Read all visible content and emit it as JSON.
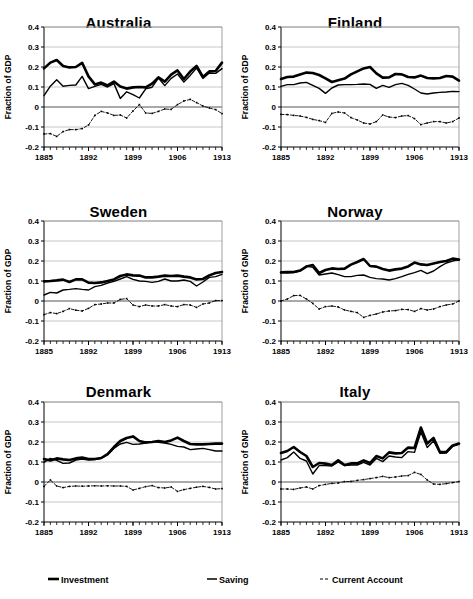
{
  "legend": {
    "position": "bottom",
    "items": [
      {
        "label": "Investment",
        "key": "thick-solid-line",
        "color": "#000000"
      },
      {
        "label": "Saving",
        "key": "thin-solid-line",
        "color": "#000000"
      },
      {
        "label": "Current Account",
        "key": "dashed-line",
        "color": "#000000"
      }
    ]
  },
  "axes": {
    "ytick_labels": [
      "0.4",
      "0.3",
      "0.2",
      "0.1",
      "0",
      "-0.1",
      "-0.2"
    ],
    "ytick_values": [
      0.4,
      0.3,
      0.2,
      0.1,
      0,
      -0.1,
      -0.2
    ],
    "xtick_labels": [
      "1885",
      "1892",
      "1899",
      "1906",
      "1913"
    ],
    "xtick_values": [
      1885,
      1892,
      1899,
      1906,
      1913
    ],
    "xlim": [
      1885,
      1913
    ],
    "ylim": [
      -0.2,
      0.4
    ],
    "minor_xtick_step": 1,
    "grid": "horizontal-only"
  },
  "chart_data": [
    {
      "type": "line",
      "title": "Australia",
      "xlabel": "",
      "ylabel": "Fraction of GDP",
      "xlim": [
        1885,
        1913
      ],
      "ylim": [
        -0.2,
        0.4
      ],
      "x": [
        1885,
        1886,
        1887,
        1888,
        1889,
        1890,
        1891,
        1892,
        1893,
        1894,
        1895,
        1896,
        1897,
        1898,
        1899,
        1900,
        1901,
        1902,
        1903,
        1904,
        1905,
        1906,
        1907,
        1908,
        1909,
        1910,
        1911,
        1912,
        1913
      ],
      "series": [
        {
          "name": "Investment",
          "style": "thick-solid",
          "values": [
            0.193,
            0.222,
            0.235,
            0.205,
            0.198,
            0.2,
            0.221,
            0.153,
            0.113,
            0.122,
            0.108,
            0.127,
            0.102,
            0.092,
            0.098,
            0.1,
            0.098,
            0.117,
            0.148,
            0.127,
            0.162,
            0.183,
            0.14,
            0.177,
            0.205,
            0.15,
            0.178,
            0.18,
            0.222
          ]
        },
        {
          "name": "Saving",
          "style": "thin-solid",
          "values": [
            0.057,
            0.104,
            0.136,
            0.104,
            0.108,
            0.11,
            0.153,
            0.092,
            0.103,
            0.113,
            0.1,
            0.117,
            0.043,
            0.076,
            0.062,
            0.045,
            0.091,
            0.099,
            0.145,
            0.107,
            0.143,
            0.165,
            0.125,
            0.158,
            0.195,
            0.143,
            0.17,
            0.168,
            0.192
          ]
        },
        {
          "name": "Current Account",
          "style": "dashed",
          "values": [
            -0.135,
            -0.133,
            -0.147,
            -0.123,
            -0.113,
            -0.113,
            -0.108,
            -0.09,
            -0.042,
            -0.022,
            -0.03,
            -0.042,
            -0.04,
            -0.055,
            -0.02,
            0.012,
            -0.03,
            -0.032,
            -0.022,
            -0.01,
            -0.012,
            0.012,
            0.03,
            0.038,
            0.022,
            0.005,
            -0.005,
            -0.013,
            -0.033
          ]
        }
      ]
    },
    {
      "type": "line",
      "title": "Finland",
      "xlabel": "",
      "ylabel": "Fraction of GDP",
      "xlim": [
        1885,
        1913
      ],
      "ylim": [
        -0.2,
        0.4
      ],
      "x": [
        1885,
        1886,
        1887,
        1888,
        1889,
        1890,
        1891,
        1892,
        1893,
        1894,
        1895,
        1896,
        1897,
        1898,
        1899,
        1900,
        1901,
        1902,
        1903,
        1904,
        1905,
        1906,
        1907,
        1908,
        1909,
        1910,
        1911,
        1912,
        1913
      ],
      "series": [
        {
          "name": "Investment",
          "style": "thick-solid",
          "values": [
            0.14,
            0.15,
            0.152,
            0.163,
            0.172,
            0.17,
            0.16,
            0.143,
            0.125,
            0.134,
            0.142,
            0.163,
            0.178,
            0.193,
            0.2,
            0.168,
            0.147,
            0.148,
            0.165,
            0.163,
            0.15,
            0.148,
            0.157,
            0.145,
            0.143,
            0.145,
            0.155,
            0.152,
            0.132
          ]
        },
        {
          "name": "Saving",
          "style": "thin-solid",
          "values": [
            0.103,
            0.112,
            0.112,
            0.12,
            0.123,
            0.108,
            0.093,
            0.068,
            0.095,
            0.11,
            0.112,
            0.112,
            0.113,
            0.115,
            0.113,
            0.093,
            0.108,
            0.098,
            0.112,
            0.118,
            0.108,
            0.09,
            0.07,
            0.065,
            0.07,
            0.073,
            0.075,
            0.078,
            0.077
          ]
        },
        {
          "name": "Current Account",
          "style": "dashed",
          "values": [
            -0.037,
            -0.038,
            -0.042,
            -0.045,
            -0.052,
            -0.062,
            -0.068,
            -0.077,
            -0.032,
            -0.025,
            -0.03,
            -0.053,
            -0.065,
            -0.08,
            -0.085,
            -0.073,
            -0.04,
            -0.05,
            -0.053,
            -0.045,
            -0.043,
            -0.058,
            -0.088,
            -0.08,
            -0.073,
            -0.073,
            -0.08,
            -0.073,
            -0.055
          ]
        }
      ]
    },
    {
      "type": "line",
      "title": "Sweden",
      "xlabel": "",
      "ylabel": "Fraction of GDP",
      "xlim": [
        1885,
        1913
      ],
      "ylim": [
        -0.2,
        0.4
      ],
      "x": [
        1885,
        1886,
        1887,
        1888,
        1889,
        1890,
        1891,
        1892,
        1893,
        1894,
        1895,
        1896,
        1897,
        1898,
        1899,
        1900,
        1901,
        1902,
        1903,
        1904,
        1905,
        1906,
        1907,
        1908,
        1909,
        1910,
        1911,
        1912,
        1913
      ],
      "series": [
        {
          "name": "Investment",
          "style": "thick-solid",
          "values": [
            0.098,
            0.1,
            0.103,
            0.107,
            0.095,
            0.108,
            0.108,
            0.092,
            0.09,
            0.093,
            0.1,
            0.108,
            0.125,
            0.133,
            0.128,
            0.127,
            0.118,
            0.118,
            0.122,
            0.127,
            0.125,
            0.127,
            0.122,
            0.118,
            0.108,
            0.11,
            0.128,
            0.14,
            0.145
          ]
        },
        {
          "name": "Saving",
          "style": "thin-solid",
          "values": [
            0.03,
            0.043,
            0.04,
            0.055,
            0.058,
            0.062,
            0.058,
            0.055,
            0.072,
            0.078,
            0.09,
            0.098,
            0.11,
            0.122,
            0.108,
            0.1,
            0.098,
            0.093,
            0.098,
            0.11,
            0.1,
            0.1,
            0.105,
            0.098,
            0.075,
            0.095,
            0.118,
            0.122,
            0.133
          ]
        },
        {
          "name": "Current Account",
          "style": "dashed",
          "values": [
            -0.068,
            -0.058,
            -0.063,
            -0.052,
            -0.038,
            -0.046,
            -0.05,
            -0.037,
            -0.018,
            -0.015,
            -0.01,
            -0.01,
            0.008,
            0.012,
            -0.02,
            -0.028,
            -0.02,
            -0.025,
            -0.025,
            -0.018,
            -0.025,
            -0.028,
            -0.018,
            -0.02,
            -0.032,
            -0.015,
            -0.01,
            0.002,
            0.002
          ]
        }
      ]
    },
    {
      "type": "line",
      "title": "Norway",
      "xlabel": "",
      "ylabel": "Fraction of GNP",
      "xlim": [
        1885,
        1913
      ],
      "ylim": [
        -0.2,
        0.4
      ],
      "x": [
        1885,
        1886,
        1887,
        1888,
        1889,
        1890,
        1891,
        1892,
        1893,
        1894,
        1895,
        1896,
        1897,
        1898,
        1899,
        1900,
        1901,
        1902,
        1903,
        1904,
        1905,
        1906,
        1907,
        1908,
        1909,
        1910,
        1911,
        1912,
        1913
      ],
      "series": [
        {
          "name": "Investment",
          "style": "thick-solid",
          "values": [
            0.143,
            0.145,
            0.145,
            0.152,
            0.172,
            0.18,
            0.14,
            0.155,
            0.163,
            0.16,
            0.162,
            0.182,
            0.195,
            0.21,
            0.175,
            0.172,
            0.16,
            0.152,
            0.158,
            0.162,
            0.173,
            0.192,
            0.183,
            0.18,
            0.188,
            0.195,
            0.2,
            0.212,
            0.207
          ]
        },
        {
          "name": "Saving",
          "style": "thin-solid",
          "values": [
            0.142,
            0.14,
            0.142,
            0.15,
            0.175,
            0.168,
            0.13,
            0.135,
            0.14,
            0.132,
            0.122,
            0.122,
            0.128,
            0.13,
            0.118,
            0.112,
            0.11,
            0.105,
            0.112,
            0.122,
            0.133,
            0.142,
            0.153,
            0.137,
            0.15,
            0.172,
            0.19,
            0.2,
            0.207
          ]
        },
        {
          "name": "Current Account",
          "style": "dashed",
          "values": [
            0.0,
            0.01,
            0.027,
            0.028,
            0.01,
            -0.012,
            -0.04,
            -0.028,
            -0.025,
            -0.03,
            -0.045,
            -0.052,
            -0.058,
            -0.082,
            -0.072,
            -0.065,
            -0.055,
            -0.05,
            -0.048,
            -0.042,
            -0.043,
            -0.052,
            -0.038,
            -0.045,
            -0.04,
            -0.028,
            -0.02,
            -0.015,
            0.0
          ]
        }
      ]
    },
    {
      "type": "line",
      "title": "Denmark",
      "xlabel": "",
      "ylabel": "Fraction of GDP",
      "xlim": [
        1885,
        1913
      ],
      "ylim": [
        -0.2,
        0.4
      ],
      "x": [
        1885,
        1886,
        1887,
        1888,
        1889,
        1890,
        1891,
        1892,
        1893,
        1894,
        1895,
        1896,
        1897,
        1898,
        1899,
        1900,
        1901,
        1902,
        1903,
        1904,
        1905,
        1906,
        1907,
        1908,
        1909,
        1910,
        1911,
        1912,
        1913
      ],
      "series": [
        {
          "name": "Investment",
          "style": "thick-solid",
          "values": [
            0.115,
            0.108,
            0.118,
            0.113,
            0.11,
            0.118,
            0.122,
            0.115,
            0.115,
            0.12,
            0.14,
            0.175,
            0.205,
            0.22,
            0.228,
            0.205,
            0.198,
            0.2,
            0.205,
            0.2,
            0.208,
            0.222,
            0.205,
            0.19,
            0.188,
            0.188,
            0.19,
            0.192,
            0.192
          ]
        },
        {
          "name": "Saving",
          "style": "thin-solid",
          "values": [
            0.098,
            0.118,
            0.108,
            0.093,
            0.095,
            0.11,
            0.115,
            0.11,
            0.112,
            0.118,
            0.135,
            0.168,
            0.19,
            0.198,
            0.188,
            0.19,
            0.195,
            0.202,
            0.198,
            0.195,
            0.188,
            0.178,
            0.175,
            0.162,
            0.165,
            0.168,
            0.162,
            0.155,
            0.155
          ]
        },
        {
          "name": "Current Account",
          "style": "dashed",
          "values": [
            -0.022,
            0.01,
            -0.02,
            -0.028,
            -0.022,
            -0.02,
            -0.021,
            -0.02,
            -0.019,
            -0.02,
            -0.019,
            -0.02,
            -0.02,
            -0.022,
            -0.04,
            -0.032,
            -0.023,
            -0.018,
            -0.028,
            -0.03,
            -0.025,
            -0.047,
            -0.038,
            -0.032,
            -0.026,
            -0.022,
            -0.027,
            -0.035,
            -0.033
          ]
        }
      ]
    },
    {
      "type": "line",
      "title": "Italy",
      "xlabel": "",
      "ylabel": "Fraction of GNP",
      "xlim": [
        1885,
        1913
      ],
      "ylim": [
        -0.2,
        0.4
      ],
      "x": [
        1885,
        1886,
        1887,
        1888,
        1889,
        1890,
        1891,
        1892,
        1893,
        1894,
        1895,
        1896,
        1897,
        1898,
        1899,
        1900,
        1901,
        1902,
        1903,
        1904,
        1905,
        1906,
        1907,
        1908,
        1909,
        1910,
        1911,
        1912,
        1913
      ],
      "series": [
        {
          "name": "Investment",
          "style": "thick-solid",
          "values": [
            0.145,
            0.155,
            0.175,
            0.15,
            0.13,
            0.075,
            0.095,
            0.092,
            0.085,
            0.108,
            0.085,
            0.093,
            0.093,
            0.108,
            0.095,
            0.13,
            0.118,
            0.148,
            0.143,
            0.145,
            0.172,
            0.17,
            0.272,
            0.192,
            0.22,
            0.15,
            0.15,
            0.183,
            0.192
          ]
        },
        {
          "name": "Saving",
          "style": "thin-solid",
          "values": [
            0.11,
            0.122,
            0.15,
            0.118,
            0.105,
            0.04,
            0.082,
            0.082,
            0.08,
            0.1,
            0.082,
            0.085,
            0.085,
            0.098,
            0.085,
            0.118,
            0.102,
            0.13,
            0.125,
            0.122,
            0.152,
            0.148,
            0.25,
            0.172,
            0.205,
            0.143,
            0.145,
            0.178,
            0.188
          ]
        },
        {
          "name": "Current Account",
          "style": "dashed",
          "values": [
            -0.035,
            -0.035,
            -0.037,
            -0.03,
            -0.025,
            -0.035,
            -0.018,
            -0.012,
            -0.007,
            -0.005,
            0.002,
            0.003,
            0.008,
            0.012,
            0.017,
            0.022,
            0.028,
            0.022,
            0.025,
            0.03,
            0.032,
            0.048,
            0.038,
            0.01,
            -0.01,
            -0.012,
            -0.008,
            -0.003,
            0.002
          ]
        }
      ]
    }
  ]
}
